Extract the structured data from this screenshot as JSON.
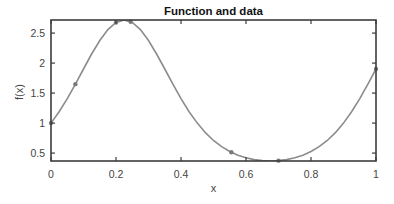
{
  "chart_data": {
    "type": "line",
    "title": "Function and data",
    "xlabel": "x",
    "ylabel": "f(x)",
    "xlim": [
      0,
      1
    ],
    "ylim": [
      0.3679,
      2.7183
    ],
    "grid": false,
    "legend": null,
    "xticks": [
      0,
      0.2,
      0.4,
      0.6,
      0.8,
      1
    ],
    "xtick_labels": [
      "0",
      "0.2",
      "0.4",
      "0.6",
      "0.8",
      "1"
    ],
    "yticks": [
      0.5,
      1,
      1.5,
      2,
      2.5
    ],
    "ytick_labels": [
      "0.5",
      "1",
      "1.5",
      "2",
      "2.5"
    ],
    "series": [
      {
        "name": "function",
        "style": "line",
        "color": "#8c8c8c",
        "x": [
          0,
          0.025,
          0.05,
          0.075,
          0.1,
          0.125,
          0.15,
          0.175,
          0.2,
          0.225,
          0.25,
          0.275,
          0.3,
          0.325,
          0.35,
          0.375,
          0.4,
          0.425,
          0.45,
          0.475,
          0.5,
          0.525,
          0.55,
          0.575,
          0.6,
          0.625,
          0.65,
          0.675,
          0.7,
          0.725,
          0.75,
          0.775,
          0.8,
          0.825,
          0.85,
          0.875,
          0.9,
          0.925,
          0.95,
          0.975,
          1.0
        ],
        "y": [
          1.0,
          1.19,
          1.408,
          1.649,
          1.902,
          2.151,
          2.377,
          2.559,
          2.677,
          2.718,
          2.677,
          2.559,
          2.377,
          2.151,
          1.902,
          1.649,
          1.408,
          1.19,
          1.0,
          0.84,
          0.71,
          0.607,
          0.526,
          0.465,
          0.421,
          0.391,
          0.374,
          0.368,
          0.374,
          0.391,
          0.421,
          0.465,
          0.526,
          0.607,
          0.71,
          0.84,
          1.0,
          1.19,
          1.408,
          1.649,
          1.902
        ]
      },
      {
        "name": "data",
        "style": "markers",
        "color": "#7a7a7a",
        "x": [
          0,
          0.075,
          0.2,
          0.245,
          0.555,
          0.7,
          1.0
        ],
        "y": [
          1.0,
          1.649,
          2.677,
          2.69,
          0.515,
          0.374,
          1.902
        ]
      }
    ]
  }
}
